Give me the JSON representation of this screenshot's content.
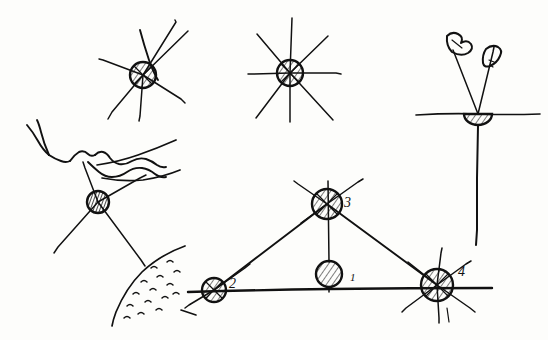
{
  "figure": {
    "medium": "pen-and-ink field sketch",
    "ink_color": "#111111",
    "paper_color": "#fdfdfb",
    "width": 548,
    "height": 340
  },
  "symbols": {
    "station_hatched_circle": "hatched-circle-station",
    "station_half_circle": "hatched-semicircle-station",
    "ray": "sight-line-ray",
    "baseline": "survey-baseline",
    "triangle_leg": "triangulation-leg",
    "stream": "stream-channel-line",
    "slope_hatching": "slope-stipple-marks",
    "flag_mark": "signal-flag-mark"
  },
  "station_labels": [
    {
      "id": "1",
      "text": "1",
      "x": 350,
      "y": 281
    },
    {
      "id": "2",
      "text": "2",
      "x": 229,
      "y": 288
    },
    {
      "id": "3",
      "text": "3",
      "x": 344,
      "y": 207
    },
    {
      "id": "4",
      "text": "4",
      "x": 458,
      "y": 276
    }
  ],
  "figures": [
    {
      "name": "top-left-station",
      "description": "Hatched circle station with six radiating sight rays",
      "center": [
        143,
        75
      ],
      "radius": 13,
      "ray_count": 6
    },
    {
      "name": "top-center-station",
      "description": "Hatched circle station with eight radiating sight rays including vertical and horizontal",
      "center": [
        290,
        73
      ],
      "radius": 13,
      "ray_count": 8
    },
    {
      "name": "top-right-station",
      "description": "Hatched semicircle on horizontal ground line, two sight rays above with signal flag marks, plumb line below",
      "center": [
        478,
        114
      ],
      "radius": 14,
      "ray_count": 2
    },
    {
      "name": "left-terrain-station",
      "description": "Densely hatched circle station among stream channels and a stippled slope",
      "center": [
        98,
        202
      ],
      "radius": 11,
      "ray_count": 4
    },
    {
      "name": "triangulation-network",
      "description": "Triangle of stations 2, 3 and 4 on a baseline with interior station 1",
      "stations": [
        {
          "id": "1",
          "center": [
            329,
            274
          ],
          "radius": 13,
          "type": "plain-hatched"
        },
        {
          "id": "2",
          "center": [
            214,
            290
          ],
          "radius": 12,
          "type": "hatched-rayed"
        },
        {
          "id": "3",
          "center": [
            327,
            204
          ],
          "radius": 15,
          "type": "hatched-rayed"
        },
        {
          "id": "4",
          "center": [
            437,
            285
          ],
          "radius": 16,
          "type": "hatched-rayed"
        }
      ],
      "baseline": {
        "from": [
          188,
          292
        ],
        "to": [
          492,
          288
        ]
      },
      "legs": [
        {
          "from": "2",
          "to": "3"
        },
        {
          "from": "3",
          "to": "4"
        },
        {
          "from": "2",
          "to": "4"
        }
      ]
    }
  ]
}
